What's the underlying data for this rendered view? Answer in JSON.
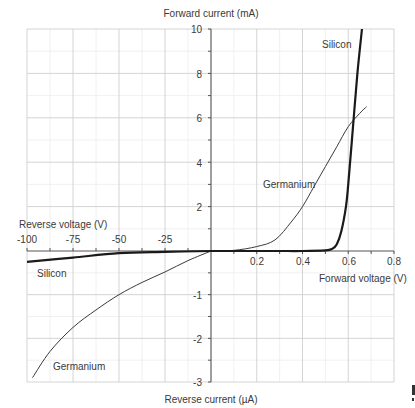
{
  "chart_data": {
    "type": "line",
    "title": "",
    "axes": {
      "forward_current_label": "Forward current (mA)",
      "reverse_current_label": "Reverse current (µA)",
      "forward_voltage_label": "Forward voltage (V)",
      "reverse_voltage_label": "Reverse voltage (V)",
      "forward_voltage_ticks": [
        "0.2",
        "0.4",
        "0.6",
        "0.8"
      ],
      "reverse_voltage_ticks": [
        "-100",
        "-75",
        "-50",
        "-25"
      ],
      "forward_current_ticks": [
        "2",
        "4",
        "6",
        "8",
        "10"
      ],
      "reverse_current_ticks": [
        "-1",
        "-2",
        "-3"
      ],
      "forward_voltage_range": [
        0,
        0.8
      ],
      "reverse_voltage_range": [
        -100,
        0
      ],
      "forward_current_range": [
        0,
        10
      ],
      "reverse_current_range": [
        -3,
        0
      ],
      "grid": true
    },
    "series": [
      {
        "name": "Silicon",
        "forward": {
          "x_V": [
            0,
            0.1,
            0.2,
            0.3,
            0.4,
            0.5,
            0.53,
            0.55,
            0.57,
            0.59,
            0.6,
            0.62,
            0.64,
            0.66
          ],
          "y_mA": [
            0,
            0,
            0,
            0,
            0,
            0.03,
            0.1,
            0.3,
            0.9,
            2.0,
            3.0,
            5.5,
            8.0,
            10.0
          ]
        },
        "reverse": {
          "x_V": [
            0,
            -25,
            -50,
            -75,
            -100
          ],
          "y_uA": [
            0,
            -0.02,
            -0.05,
            -0.15,
            -0.25
          ]
        },
        "line_width": "thick",
        "color": "#1a1a1a"
      },
      {
        "name": "Germanium",
        "forward": {
          "x_V": [
            0,
            0.1,
            0.2,
            0.28,
            0.35,
            0.4,
            0.45,
            0.5,
            0.55,
            0.6,
            0.65,
            0.68
          ],
          "y_mA": [
            0,
            0.03,
            0.2,
            0.5,
            1.3,
            2.0,
            2.9,
            3.8,
            4.7,
            5.6,
            6.2,
            6.5
          ],
          "label_position": "middle-left"
        },
        "reverse": {
          "x_V": [
            0,
            -12.5,
            -25,
            -37.5,
            -50,
            -62.5,
            -75,
            -87.5,
            -97
          ],
          "y_uA": [
            0,
            -0.22,
            -0.48,
            -0.72,
            -1.0,
            -1.35,
            -1.75,
            -2.3,
            -2.9
          ]
        },
        "line_width": "thin",
        "color": "#3a3a3a"
      }
    ],
    "annotations": [
      {
        "text": "Silicon",
        "quadrant": "forward"
      },
      {
        "text": "Germanium",
        "quadrant": "forward"
      },
      {
        "text": "Silicon",
        "quadrant": "reverse"
      },
      {
        "text": "Germanium",
        "quadrant": "reverse"
      }
    ]
  },
  "labels": {
    "forward_current": "Forward current (mA)",
    "reverse_current": "Reverse current (µA)",
    "forward_voltage": "Forward voltage (V)",
    "reverse_voltage": "Reverse voltage (V)",
    "silicon_fwd": "Silicon",
    "germanium_fwd": "Germanium",
    "silicon_rev": "Silicon",
    "germanium_rev": "Germanium"
  },
  "ticks": {
    "xr": [
      "-100",
      "-75",
      "-50",
      "-25"
    ],
    "xf": [
      "0.2",
      "0.4",
      "0.6",
      "0.8"
    ],
    "yf": [
      "10",
      "8",
      "6",
      "4",
      "2"
    ],
    "yr": [
      "-1",
      "-2",
      "-3"
    ]
  }
}
